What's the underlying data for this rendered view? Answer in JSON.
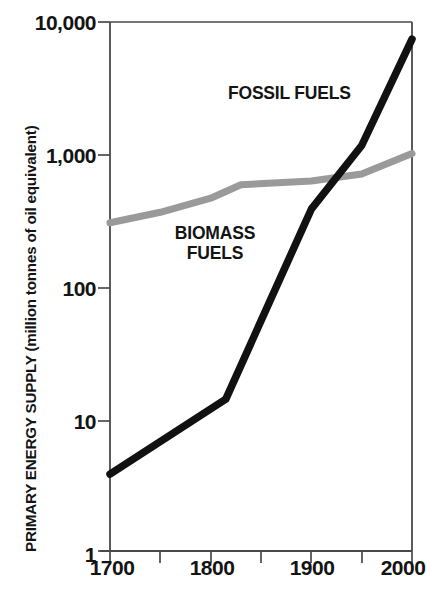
{
  "chart_data": {
    "type": "line",
    "title": "",
    "xlabel": "",
    "ylabel": "PRIMARY ENERGY SUPPLY (million tonnes of oil equivalent)",
    "yscale": "log",
    "ylim": [
      1,
      10000
    ],
    "xlim": [
      1700,
      2000
    ],
    "grid": false,
    "legend_position": "inline-annotations",
    "y_tick_labels": [
      "10,000",
      "1,000",
      "100",
      "10",
      "1"
    ],
    "y_tick_values": [
      10000,
      1000,
      100,
      10,
      1
    ],
    "x_tick_labels": [
      "1700",
      "1800",
      "1900",
      "2000"
    ],
    "x_tick_values": [
      1700,
      1800,
      1900,
      2000
    ],
    "x_minor_ticks": [
      1750,
      1850,
      1950
    ],
    "series": [
      {
        "name": "FOSSIL FUELS",
        "color": "#111111",
        "x": [
          1700,
          1815,
          1900,
          1950,
          2000
        ],
        "values": [
          3.8,
          14,
          380,
          1150,
          7300
        ]
      },
      {
        "name": "BIOMASS FUELS",
        "color": "#9a9a9a",
        "x": [
          1700,
          1750,
          1800,
          1830,
          1900,
          1950,
          2000
        ],
        "values": [
          300,
          360,
          460,
          580,
          620,
          700,
          1000
        ]
      }
    ],
    "annotations": [
      {
        "text": "FOSSIL FUELS",
        "series": "FOSSIL FUELS"
      },
      {
        "text_line1": "BIOMASS",
        "text_line2": "FUELS",
        "series": "BIOMASS FUELS"
      }
    ]
  },
  "axis": {
    "y_title": "PRIMARY ENERGY SUPPLY (million tonnes of oil equivalent)",
    "ticks_y": {
      "t0": "10,000",
      "t1": "1,000",
      "t2": "100",
      "t3": "10",
      "t4": "1"
    },
    "ticks_x": {
      "t0": "1700",
      "t1": "1800",
      "t2": "1900",
      "t3": "2000"
    }
  },
  "labels": {
    "fossil": "FOSSIL FUELS",
    "biomass_line1": "BIOMASS",
    "biomass_line2": "FUELS"
  },
  "colors": {
    "fossil_line": "#111111",
    "biomass_line": "#9a9a9a",
    "axis": "#4a4a4a",
    "text": "#141414",
    "background": "#ffffff"
  }
}
